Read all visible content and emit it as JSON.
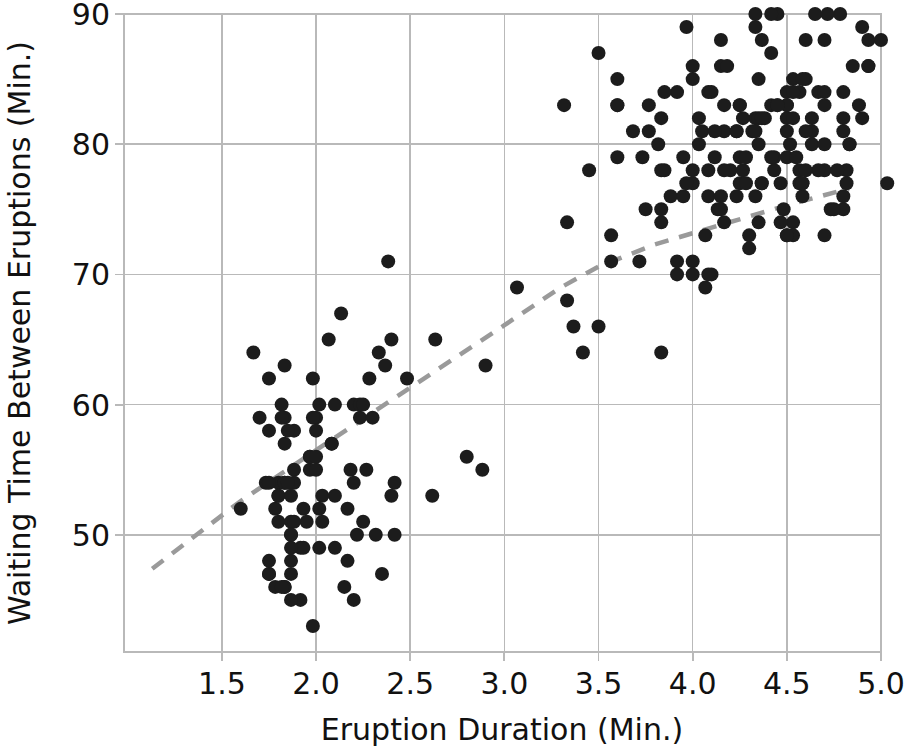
{
  "chart_data": {
    "type": "scatter",
    "title": "",
    "xlabel": "Eruption Duration (Min.)",
    "ylabel": "Waiting Time Between Eruptions (Min.)",
    "xlim": [
      0.98,
      5.0
    ],
    "ylim": [
      41.0,
      90.0
    ],
    "xticks": [
      1.5,
      2.0,
      2.5,
      3.0,
      3.5,
      4.0,
      4.5,
      5.0
    ],
    "xtick_labels": [
      "1.5",
      "2.0",
      "2.5",
      "3.0",
      "3.5",
      "4.0",
      "4.5",
      "5.0"
    ],
    "yticks": [
      50,
      60,
      70,
      80,
      90
    ],
    "ytick_labels": [
      "50",
      "60",
      "70",
      "80",
      "90"
    ],
    "grid": true,
    "legend": null,
    "marker_color": "#1c1c1c",
    "marker_size": 7,
    "trendline": {
      "style": "dashed",
      "color": "#9a9a9a",
      "points": [
        [
          1.13,
          47.4
        ],
        [
          1.6,
          52.6
        ],
        [
          2.0,
          56.5
        ],
        [
          2.5,
          61.3
        ],
        [
          3.0,
          66.1
        ],
        [
          3.3,
          69.0
        ],
        [
          3.5,
          70.6
        ],
        [
          3.8,
          72.3
        ],
        [
          4.1,
          73.6
        ],
        [
          4.5,
          75.3
        ],
        [
          4.83,
          76.6
        ]
      ]
    },
    "x": [
      3.6,
      1.8,
      3.333,
      2.283,
      4.533,
      2.883,
      4.7,
      3.6,
      1.95,
      4.35,
      1.833,
      3.917,
      4.2,
      1.75,
      4.7,
      2.167,
      1.75,
      4.8,
      1.6,
      4.25,
      1.8,
      1.75,
      3.45,
      3.067,
      4.533,
      3.6,
      1.967,
      4.083,
      3.85,
      4.433,
      4.3,
      4.467,
      3.367,
      4.033,
      3.833,
      2.017,
      1.867,
      4.833,
      1.833,
      4.783,
      4.35,
      1.883,
      4.567,
      1.75,
      4.533,
      3.317,
      3.833,
      2.1,
      4.633,
      2.0,
      4.8,
      4.716,
      1.833,
      4.833,
      1.733,
      4.883,
      3.717,
      1.667,
      4.567,
      4.317,
      2.233,
      4.5,
      1.75,
      4.8,
      1.817,
      4.4,
      4.167,
      4.7,
      2.067,
      4.7,
      4.033,
      1.967,
      4.5,
      4.0,
      1.983,
      5.067,
      2.017,
      4.567,
      3.883,
      3.6,
      4.133,
      4.333,
      4.1,
      2.633,
      4.067,
      4.933,
      3.95,
      4.517,
      2.167,
      4.0,
      2.2,
      4.333,
      1.867,
      4.817,
      1.833,
      4.3,
      4.667,
      3.75,
      1.867,
      4.9,
      2.483,
      4.367,
      2.1,
      4.5,
      4.05,
      1.867,
      4.7,
      1.783,
      4.85,
      3.683,
      4.733,
      2.3,
      4.9,
      4.417,
      1.7,
      4.633,
      2.317,
      4.6,
      1.817,
      4.417,
      2.617,
      4.067,
      4.25,
      1.967,
      4.6,
      3.767,
      1.917,
      4.5,
      2.267,
      4.65,
      1.867,
      4.167,
      2.8,
      4.333,
      1.833,
      4.383,
      1.883,
      4.933,
      2.033,
      3.733,
      4.233,
      2.233,
      4.533,
      4.817,
      4.333,
      1.983,
      4.633,
      2.017,
      5.1,
      1.8,
      5.033,
      4.0,
      2.4,
      4.6,
      3.567,
      4.0,
      4.5,
      4.083,
      1.8,
      3.967,
      2.2,
      4.15,
      2.0,
      3.833,
      3.5,
      4.583,
      2.367,
      5.0,
      1.933,
      4.617,
      1.917,
      2.083,
      4.583,
      3.333,
      4.167,
      4.333,
      4.5,
      2.417,
      4.0,
      4.167,
      1.883,
      4.583,
      4.25,
      3.767,
      2.033,
      4.433,
      4.083,
      1.833,
      4.417,
      2.183,
      4.8,
      1.833,
      4.8,
      4.1,
      3.966,
      4.233,
      3.5,
      4.366,
      2.25,
      4.667,
      2.1,
      4.35,
      4.133,
      1.867,
      4.6,
      1.783,
      4.367,
      3.85,
      1.933,
      4.5,
      2.383,
      4.7,
      1.867,
      3.833,
      3.417,
      4.233,
      2.4,
      4.8,
      2.0,
      4.15,
      1.867,
      4.267,
      1.75,
      4.483,
      4.0,
      4.117,
      4.083,
      4.267,
      3.917,
      4.55,
      4.083,
      2.417,
      4.183,
      2.217,
      4.45,
      1.883,
      1.85,
      4.283,
      3.95,
      2.333,
      4.15,
      2.35,
      4.933,
      2.9,
      4.583,
      3.833,
      2.083,
      4.367,
      2.133,
      4.35,
      2.2,
      4.45,
      3.567,
      4.5,
      4.15,
      3.817,
      3.917,
      4.45,
      2.0,
      4.283,
      4.767,
      4.533,
      1.85,
      4.25,
      1.983,
      2.25,
      4.75,
      4.117,
      2.15,
      4.417,
      1.817,
      4.467
    ],
    "y": [
      79,
      54,
      74,
      62,
      85,
      55,
      88,
      85,
      51,
      85,
      54,
      84,
      78,
      47,
      83,
      52,
      62,
      84,
      52,
      79,
      51,
      47,
      78,
      69,
      74,
      83,
      55,
      76,
      78,
      79,
      73,
      77,
      66,
      80,
      74,
      52,
      48,
      80,
      59,
      90,
      80,
      58,
      84,
      58,
      73,
      83,
      64,
      53,
      82,
      59,
      75,
      90,
      54,
      80,
      54,
      83,
      71,
      64,
      77,
      81,
      59,
      84,
      48,
      82,
      60,
      92,
      78,
      78,
      65,
      73,
      82,
      56,
      79,
      71,
      62,
      76,
      60,
      78,
      76,
      83,
      75,
      82,
      70,
      65,
      73,
      88,
      76,
      80,
      48,
      86,
      60,
      90,
      50,
      78,
      63,
      72,
      84,
      75,
      51,
      82,
      62,
      88,
      49,
      83,
      81,
      47,
      84,
      52,
      86,
      81,
      75,
      59,
      89,
      79,
      59,
      81,
      50,
      85,
      59,
      87,
      53,
      69,
      77,
      56,
      88,
      81,
      45,
      82,
      55,
      90,
      45,
      83,
      56,
      89,
      46,
      82,
      51,
      86,
      53,
      79,
      81,
      60,
      82,
      77,
      76,
      59,
      80,
      49,
      96,
      53,
      77,
      77,
      65,
      81,
      71,
      70,
      81,
      93,
      53,
      89,
      45,
      86,
      58,
      78,
      66,
      76,
      63,
      88,
      52,
      93,
      49,
      57,
      77,
      68,
      81,
      81,
      73,
      50,
      85,
      74,
      55,
      77,
      83,
      83,
      51,
      78,
      84,
      46,
      83,
      55,
      81,
      57,
      76,
      84,
      77,
      81,
      87,
      77,
      51,
      78,
      60,
      82,
      91,
      53,
      78,
      46,
      77,
      84,
      49,
      83,
      71,
      80,
      49,
      75,
      64,
      76,
      53,
      94,
      55,
      76,
      50,
      82,
      54,
      75,
      78,
      79,
      78,
      78,
      70,
      79,
      70,
      54,
      86,
      50,
      90,
      54,
      54,
      77,
      79,
      64,
      75,
      47,
      86,
      63,
      85,
      82,
      57,
      82,
      67,
      74,
      54,
      83,
      73,
      73,
      88,
      80,
      71,
      83,
      56,
      79,
      78,
      84,
      58,
      83,
      43,
      60,
      75,
      81,
      46,
      90,
      46,
      74
    ]
  },
  "axes": {
    "xlabel": "Eruption Duration (Min.)",
    "ylabel": "Waiting Time Between Eruptions (Min.)"
  }
}
